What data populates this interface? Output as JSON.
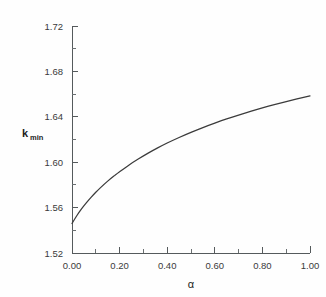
{
  "chart_data": {
    "type": "line",
    "title": "",
    "subtitle": "",
    "xlabel": "α",
    "ylabel": "k",
    "ylabel_subscript": "min",
    "xlim": [
      0.0,
      1.0
    ],
    "ylim": [
      1.52,
      1.72
    ],
    "grid": false,
    "legend": null,
    "legend_position": "none",
    "x_ticks": [
      0.0,
      0.2,
      0.4,
      0.6,
      0.8,
      1.0
    ],
    "x_tick_labels": [
      "0.00",
      "0.20",
      "0.40",
      "0.60",
      "0.80",
      "1.00"
    ],
    "x_minor_ticks": [
      0.1,
      0.3,
      0.5,
      0.7,
      0.9
    ],
    "y_ticks": [
      1.52,
      1.56,
      1.6,
      1.64,
      1.68,
      1.72
    ],
    "y_tick_labels": [
      "1.52",
      "1.56",
      "1.60",
      "1.64",
      "1.68",
      "1.72"
    ],
    "y_minor_ticks": [
      1.54,
      1.58,
      1.62,
      1.66,
      1.7
    ],
    "series": [
      {
        "name": "k_min(alpha)",
        "color": "#3b3b3b",
        "x": [
          0.0,
          0.02,
          0.04,
          0.06,
          0.08,
          0.1,
          0.12,
          0.15,
          0.18,
          0.2,
          0.24,
          0.28,
          0.32,
          0.36,
          0.4,
          0.45,
          0.5,
          0.55,
          0.6,
          0.65,
          0.7,
          0.75,
          0.8,
          0.85,
          0.9,
          0.95,
          1.0
        ],
        "y": [
          1.546,
          1.5528,
          1.5588,
          1.5641,
          1.569,
          1.5735,
          1.5776,
          1.5833,
          1.5884,
          1.5916,
          1.5976,
          1.603,
          1.608,
          1.6126,
          1.6169,
          1.6218,
          1.6263,
          1.6305,
          1.6344,
          1.6381,
          1.6415,
          1.6447,
          1.6478,
          1.6507,
          1.6534,
          1.656,
          1.6585
        ]
      }
    ]
  },
  "axes": {
    "y_label_main": "k",
    "y_label_sub": "min",
    "x_label": "α"
  }
}
